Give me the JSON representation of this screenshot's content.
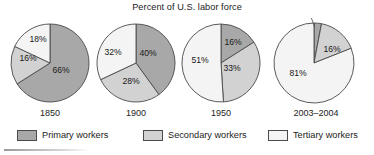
{
  "chart_data": {
    "type": "pie",
    "title": "Percent of U.S. labor force",
    "xlabel": "",
    "ylabel": "",
    "legend_position": "bottom",
    "grid": false,
    "series": [
      {
        "name": "Primary workers",
        "color": "#a8a8a8",
        "values": [
          66,
          40,
          16,
          3
        ]
      },
      {
        "name": "Secondary workers",
        "color": "#d2d2d2",
        "values": [
          16,
          28,
          33,
          16
        ]
      },
      {
        "name": "Tertiary workers",
        "color": "#f0f0f0",
        "values": [
          18,
          32,
          51,
          81
        ]
      }
    ],
    "categories": [
      "1850",
      "1900",
      "1950",
      "2003–2004"
    ],
    "charts": [
      {
        "year": "1850",
        "slices": [
          {
            "category": "Primary workers",
            "value": 66,
            "label": "66%",
            "color": "#a8a8a8"
          },
          {
            "category": "Secondary workers",
            "value": 16,
            "label": "16%",
            "color": "#d2d2d2"
          },
          {
            "category": "Tertiary workers",
            "value": 18,
            "label": "18%",
            "color": "#f4f4f4"
          }
        ]
      },
      {
        "year": "1900",
        "slices": [
          {
            "category": "Primary workers",
            "value": 40,
            "label": "40%",
            "color": "#a8a8a8"
          },
          {
            "category": "Secondary workers",
            "value": 28,
            "label": "28%",
            "color": "#d2d2d2"
          },
          {
            "category": "Tertiary workers",
            "value": 32,
            "label": "32%",
            "color": "#f4f4f4"
          }
        ]
      },
      {
        "year": "1950",
        "slices": [
          {
            "category": "Primary workers",
            "value": 16,
            "label": "16%",
            "color": "#a8a8a8"
          },
          {
            "category": "Secondary workers",
            "value": 33,
            "label": "33%",
            "color": "#d2d2d2"
          },
          {
            "category": "Tertiary workers",
            "value": 51,
            "label": "51%",
            "color": "#f4f4f4"
          }
        ]
      },
      {
        "year": "2003–2004",
        "slices": [
          {
            "category": "Primary workers",
            "value": 3,
            "label": "3%",
            "color": "#a8a8a8"
          },
          {
            "category": "Secondary workers",
            "value": 16,
            "label": "16%",
            "color": "#d2d2d2"
          },
          {
            "category": "Tertiary workers",
            "value": 81,
            "label": "81%",
            "color": "#f4f4f4"
          }
        ]
      }
    ]
  },
  "title": "Percent of U.S. labor force",
  "pies": [
    {
      "year": "1850",
      "labels": {
        "primary": "66%",
        "secondary": "16%",
        "tertiary": "18%"
      }
    },
    {
      "year": "1900",
      "labels": {
        "primary": "40%",
        "secondary": "28%",
        "tertiary": "32%"
      }
    },
    {
      "year": "1950",
      "labels": {
        "primary": "16%",
        "secondary": "33%",
        "tertiary": "51%"
      }
    },
    {
      "year": "2003–2004",
      "labels": {
        "primary": "3%",
        "secondary": "16%",
        "tertiary": "81%"
      }
    }
  ],
  "legend": {
    "items": [
      {
        "label": "Primary workers",
        "color": "#a8a8a8"
      },
      {
        "label": "Secondary workers",
        "color": "#d2d2d2"
      },
      {
        "label": "Tertiary workers",
        "color": "#f4f4f4"
      }
    ]
  },
  "colors": {
    "primary": "#a8a8a8",
    "secondary": "#d2d2d2",
    "tertiary": "#f4f4f4",
    "outline": "#4a4a4a",
    "text": "#1c1c1c"
  }
}
